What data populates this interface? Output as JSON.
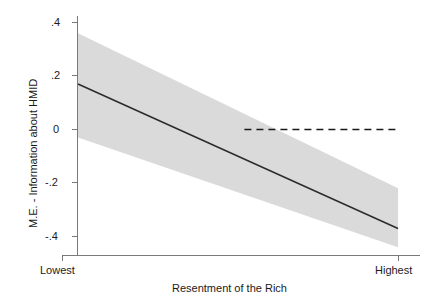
{
  "chart_data": {
    "type": "line",
    "title": "",
    "subtitle": "",
    "xlabel": "Resentment of the Rich",
    "ylabel": "M.E. - Information about HMID",
    "x": [
      0,
      1
    ],
    "xtick_labels": [
      "Lowest",
      "Highest"
    ],
    "xtick_values": [
      0,
      1
    ],
    "xlim": [
      0,
      1
    ],
    "ylim": [
      -0.48,
      0.44
    ],
    "ytick_labels": [
      ".4",
      ".2",
      "0",
      "-.2",
      "-.4"
    ],
    "ytick_values": [
      0.4,
      0.2,
      0,
      -0.2,
      -0.4
    ],
    "grid": false,
    "legend": "none",
    "series": [
      {
        "name": "Marginal effect",
        "style": "solid-line",
        "color": "#2b2b2b",
        "values": [
          0.17,
          -0.37
        ]
      },
      {
        "name": "95% confidence interval",
        "style": "shaded-band",
        "color": "#d4d4d4",
        "upper": [
          0.36,
          -0.22
        ],
        "lower": [
          -0.03,
          -0.44
        ]
      },
      {
        "name": "Zero reference line",
        "style": "dashed-line",
        "color": "#1a1a1a",
        "y": 0,
        "x_start": 0.52,
        "x_end": 1.0
      }
    ],
    "annotations": []
  }
}
